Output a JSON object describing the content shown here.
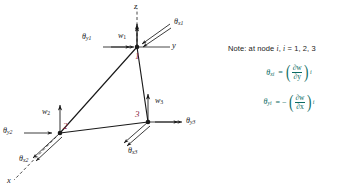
{
  "figure": {
    "type": "engineering-diagram",
    "axes": {
      "z_label": "z",
      "y_label": "y",
      "x_label": "x"
    },
    "nodes": [
      {
        "id": "1",
        "label": "1",
        "w": "w",
        "w_sub": "1",
        "theta_x": "θ",
        "theta_x_sub": "x1",
        "theta_y": "θ",
        "theta_y_sub": "y1"
      },
      {
        "id": "2",
        "label": "2",
        "w": "w",
        "w_sub": "2",
        "theta_x": "θ",
        "theta_x_sub": "x2",
        "theta_y": "θ",
        "theta_y_sub": "y2"
      },
      {
        "id": "3",
        "label": "3",
        "w": "w",
        "w_sub": "3",
        "theta_x": "θ",
        "theta_x_sub": "x3",
        "theta_y": "θ",
        "theta_y_sub": "y3"
      }
    ],
    "labels": {
      "z_axis": "z",
      "y_axis": "y",
      "x_axis": "x",
      "w1": "w",
      "w1_sub": "1",
      "w2": "w",
      "w2_sub": "2",
      "w3": "w",
      "w3_sub": "3",
      "theta_x1": "θ",
      "theta_x1_sub": "x1",
      "theta_y1": "θ",
      "theta_y1_sub": "y1",
      "theta_x2": "θ",
      "theta_x2_sub": "x2",
      "theta_y2": "θ",
      "theta_y2_sub": "y2",
      "theta_x3": "θ",
      "theta_x3_sub": "x3",
      "theta_y3": "θ",
      "theta_y3_sub": "y3",
      "node1": "1",
      "node2": "2",
      "node3": "3"
    },
    "note": {
      "prefix": "Note: at node ",
      "var1": "i",
      "comma": ", ",
      "var2": "i",
      "values": " = 1, 2, 3",
      "equation_1": {
        "lhs_symbol": "θ",
        "lhs_sub": "xi",
        "equals": "=",
        "numerator": "∂w",
        "denominator": "∂y",
        "index": "i"
      },
      "equation_2": {
        "lhs_symbol": "θ",
        "lhs_sub": "yi",
        "equals": "=",
        "sign": "−",
        "numerator": "∂w",
        "denominator": "∂x",
        "index": "i"
      }
    },
    "colors": {
      "line": "#1a1a1a",
      "node_label": "#8a2540",
      "equation": "#0b6b63",
      "background": "#ffffff"
    }
  }
}
